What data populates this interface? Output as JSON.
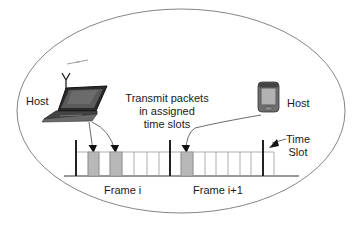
{
  "diagram": {
    "type": "TDMA time-slot allocation",
    "hosts": [
      {
        "label": "Host",
        "device": "laptop",
        "icon": "laptop-with-antenna-icon"
      },
      {
        "label": "Host",
        "device": "pda",
        "icon": "pda-icon"
      }
    ],
    "annotation": {
      "line1": "Transmit packets",
      "line2": "in assigned",
      "line3": "time slots"
    },
    "frames": [
      {
        "label": "Frame i",
        "slots": 8,
        "shaded_slots": [
          1,
          3
        ]
      },
      {
        "label": "Frame i+1",
        "slots": 8,
        "shaded_slots": [
          1
        ]
      }
    ],
    "time_slot_label": {
      "line1": "Time",
      "line2": "Slot"
    },
    "colors": {
      "outline": "#555555",
      "shaded_slot": "#b8b8b8",
      "slot_line": "#9a9a9a",
      "frame_bar": "#222222"
    }
  }
}
